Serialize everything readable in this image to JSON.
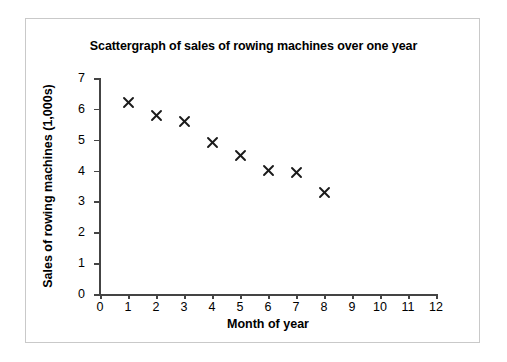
{
  "chart_data": {
    "type": "scatter",
    "title": "Scattergraph of sales of rowing machines over one year",
    "xlabel": "Month of year",
    "ylabel": "Sales of rowing machines (1,000s)",
    "xlim": [
      0,
      12
    ],
    "ylim": [
      0,
      7
    ],
    "xticks": [
      0,
      1,
      2,
      3,
      4,
      5,
      6,
      7,
      8,
      9,
      10,
      11,
      12
    ],
    "yticks": [
      0,
      1,
      2,
      3,
      4,
      5,
      6,
      7
    ],
    "grid": false,
    "legend": null,
    "marker": "x",
    "marker_color": "#1a1a1a",
    "series": [
      {
        "name": "Sales of rowing machines",
        "x": [
          1,
          2,
          3,
          4,
          5,
          6,
          7,
          8
        ],
        "y": [
          6.2,
          5.8,
          5.6,
          4.9,
          4.5,
          4.0,
          3.95,
          3.3
        ]
      }
    ]
  },
  "figure": {
    "border_color": "#c9c9c9",
    "background": "#ffffff",
    "axis_color": "#444444"
  }
}
